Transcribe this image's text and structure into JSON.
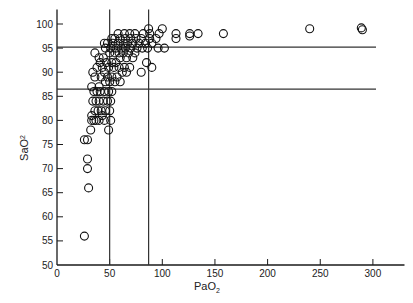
{
  "chart_data": {
    "type": "scatter",
    "title": "",
    "xlabel": "PaO2",
    "ylabel": "SaO2",
    "xlabel_main": "PaO",
    "xlabel_sub": "2",
    "ylabel_main": "SaO",
    "ylabel_sub": "2",
    "xlim": [
      0,
      320
    ],
    "ylim": [
      50,
      102
    ],
    "xticks": [
      0,
      50,
      100,
      150,
      200,
      250,
      300
    ],
    "yticks": [
      50,
      55,
      60,
      65,
      70,
      75,
      80,
      85,
      90,
      95,
      100
    ],
    "grid": false,
    "legend": null,
    "reference_lines": {
      "horizontal": [
        95.2,
        86.5
      ],
      "vertical": [
        50,
        87
      ]
    },
    "marker": "open-circle",
    "points": [
      [
        26,
        56
      ],
      [
        30,
        66
      ],
      [
        29,
        70
      ],
      [
        29,
        72
      ],
      [
        26,
        76
      ],
      [
        29,
        76
      ],
      [
        32,
        78
      ],
      [
        33,
        80
      ],
      [
        35,
        80
      ],
      [
        37,
        80
      ],
      [
        40,
        80
      ],
      [
        43,
        81
      ],
      [
        45,
        80
      ],
      [
        49,
        78
      ],
      [
        51,
        80
      ],
      [
        33,
        81
      ],
      [
        36,
        82
      ],
      [
        39,
        82
      ],
      [
        42,
        82
      ],
      [
        46,
        82
      ],
      [
        50,
        82
      ],
      [
        34,
        84
      ],
      [
        37,
        84
      ],
      [
        40,
        84
      ],
      [
        44,
        84
      ],
      [
        48,
        84
      ],
      [
        51,
        84
      ],
      [
        35,
        86
      ],
      [
        38,
        86
      ],
      [
        41,
        86
      ],
      [
        45,
        86
      ],
      [
        49,
        86
      ],
      [
        52,
        86
      ],
      [
        33,
        87
      ],
      [
        40,
        87
      ],
      [
        46,
        88
      ],
      [
        50,
        88
      ],
      [
        55,
        88
      ],
      [
        60,
        88
      ],
      [
        36,
        89
      ],
      [
        42,
        89
      ],
      [
        48,
        89
      ],
      [
        52,
        89
      ],
      [
        57,
        89
      ],
      [
        62,
        90
      ],
      [
        66,
        90
      ],
      [
        45,
        90
      ],
      [
        34,
        90
      ],
      [
        38,
        91
      ],
      [
        43,
        91
      ],
      [
        49,
        91
      ],
      [
        54,
        91
      ],
      [
        59,
        91
      ],
      [
        64,
        91
      ],
      [
        69,
        91
      ],
      [
        41,
        92
      ],
      [
        47,
        92
      ],
      [
        52,
        92
      ],
      [
        56,
        92
      ],
      [
        60,
        93
      ],
      [
        66,
        93
      ],
      [
        72,
        93
      ],
      [
        44,
        93
      ],
      [
        50,
        94
      ],
      [
        55,
        94
      ],
      [
        59,
        94
      ],
      [
        63,
        94
      ],
      [
        68,
        94
      ],
      [
        74,
        94
      ],
      [
        36,
        94
      ],
      [
        46,
        95
      ],
      [
        51,
        95
      ],
      [
        56,
        95
      ],
      [
        61,
        95
      ],
      [
        65,
        95
      ],
      [
        70,
        95
      ],
      [
        76,
        95
      ],
      [
        81,
        95
      ],
      [
        86,
        95
      ],
      [
        48,
        96
      ],
      [
        53,
        96
      ],
      [
        58,
        96
      ],
      [
        63,
        96
      ],
      [
        67,
        96
      ],
      [
        72,
        96
      ],
      [
        78,
        96
      ],
      [
        84,
        96
      ],
      [
        90,
        96
      ],
      [
        96,
        95
      ],
      [
        102,
        95
      ],
      [
        55,
        97
      ],
      [
        60,
        97
      ],
      [
        65,
        97
      ],
      [
        70,
        97
      ],
      [
        75,
        97
      ],
      [
        80,
        97
      ],
      [
        88,
        97
      ],
      [
        94,
        97
      ],
      [
        58,
        98
      ],
      [
        64,
        98
      ],
      [
        69,
        98
      ],
      [
        74,
        98
      ],
      [
        82,
        98
      ],
      [
        88,
        98
      ],
      [
        97,
        98
      ],
      [
        52,
        97
      ],
      [
        45,
        96
      ],
      [
        40,
        93
      ],
      [
        87,
        99
      ],
      [
        100,
        99
      ],
      [
        113,
        98
      ],
      [
        113,
        97
      ],
      [
        126,
        98
      ],
      [
        126,
        97.5
      ],
      [
        134,
        98
      ],
      [
        158,
        98
      ],
      [
        80,
        90
      ],
      [
        90,
        91
      ],
      [
        85,
        92
      ],
      [
        240,
        99
      ],
      [
        289,
        99.2
      ],
      [
        290,
        98.8
      ]
    ]
  }
}
